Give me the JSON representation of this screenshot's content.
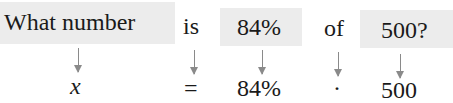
{
  "sentence": {
    "words": [
      {
        "text": "What number",
        "highlighted": true
      },
      {
        "text": "is",
        "highlighted": false
      },
      {
        "text": "84%",
        "highlighted": true
      },
      {
        "text": "of",
        "highlighted": false
      },
      {
        "text": "500?",
        "highlighted": true
      }
    ]
  },
  "equation": {
    "terms": [
      {
        "text": "x",
        "italic": true
      },
      {
        "text": "="
      },
      {
        "text": "84%"
      },
      {
        "text": "·"
      },
      {
        "text": "500"
      }
    ]
  },
  "colors": {
    "highlight_box": "#ececec",
    "arrow": "#8a8a8a",
    "text": "#1a1a1a"
  }
}
